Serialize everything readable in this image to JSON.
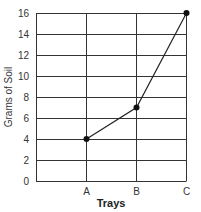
{
  "chart_data": {
    "type": "line",
    "title": "",
    "xlabel": "Trays",
    "ylabel": "Grams of Soil",
    "categories": [
      "A",
      "B",
      "C"
    ],
    "series": [
      {
        "name": "Grams of Soil",
        "values": [
          4,
          7,
          16
        ]
      }
    ],
    "ylim": [
      0,
      16
    ],
    "yticks": [
      0,
      2,
      4,
      6,
      8,
      10,
      12,
      14,
      16
    ],
    "grid": true,
    "legend": "none",
    "colors": {
      "line": "#222222",
      "grid": "#333333",
      "marker": "#111111"
    }
  }
}
